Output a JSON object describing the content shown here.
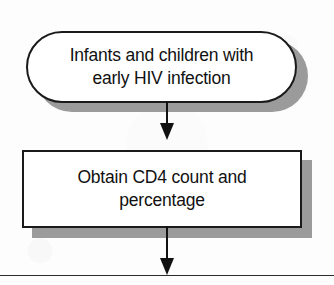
{
  "diagram": {
    "background_color": "#fdfdfd",
    "line_color": "#111111",
    "shadow_color": "#9b9b9b",
    "fill_color": "#ffffff",
    "nodes": [
      {
        "id": "start",
        "shape": "stadium",
        "line1": "Infants and children with",
        "line2": "early HIV infection"
      },
      {
        "id": "cd4",
        "shape": "rectangle",
        "line1": "Obtain CD4 count and",
        "line2": "percentage"
      }
    ],
    "connectors": [
      {
        "id": "start-to-cd4",
        "from": "start",
        "to": "cd4",
        "label": ""
      },
      {
        "id": "cd4-to-next",
        "from": "cd4",
        "to": "bottom-rule",
        "label": ""
      }
    ],
    "rules": [
      {
        "id": "bottom-rule",
        "orientation": "horizontal"
      }
    ]
  }
}
